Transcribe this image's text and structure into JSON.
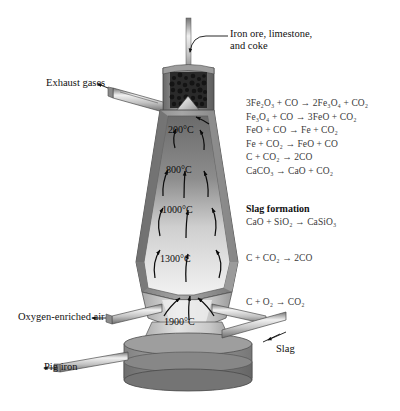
{
  "figure": {
    "type": "labeled-cross-section"
  },
  "callouts": {
    "charge": "Iron ore, limestone,",
    "charge2": "and coke",
    "exhaust": "Exhaust gases",
    "air": "Oxygen-enriched air",
    "pig_iron": "Pig iron",
    "slag": "Slag"
  },
  "temperatures": [
    {
      "label": "200°C"
    },
    {
      "label": "800°C"
    },
    {
      "label": "1000°C"
    },
    {
      "label": "1300°C"
    },
    {
      "label": "1900°C"
    }
  ],
  "reactions": {
    "reduction": [
      "3Fe₂O₃ + CO → 2Fe₃O₄ + CO₂",
      "Fe₃O₄ + CO → 3FeO + CO₂",
      "FeO + CO → Fe + CO₂",
      "Fe + CO₂ → FeO + CO",
      "C + CO₂ → 2CO",
      "CaCO₃ → CaO + CO₂"
    ],
    "slag_heading": "Slag formation",
    "slag_equation": "CaO + SiO₂ → CaSiO₃",
    "mid_equation": "C + CO₂ → 2CO",
    "low_equation": "C + O₂ → CO₂"
  },
  "colors": {
    "shell_outer": "#8f8f8f",
    "shell_inner": "#b9b9b9",
    "interior_top": "#6f6f6f",
    "interior_bottom": "#efefef",
    "pipe": "#b0b0b0",
    "charge_dark": "#1d1d1d",
    "background": "#ffffff",
    "text": "#111111"
  }
}
